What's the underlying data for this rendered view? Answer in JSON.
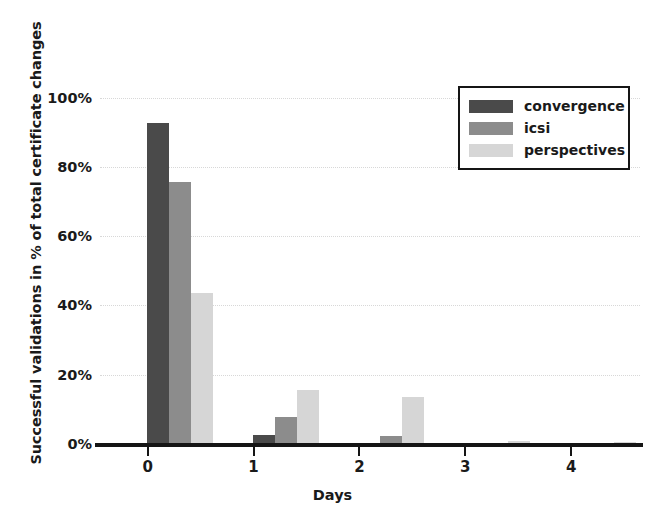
{
  "chart_data": {
    "type": "bar",
    "title": "",
    "xlabel": "Days",
    "ylabel": "Successful validations in % of total certificate changes",
    "categories": [
      "0",
      "1",
      "2",
      "3",
      "4"
    ],
    "ylim": [
      0,
      108
    ],
    "yticks": [
      0,
      20,
      40,
      60,
      80,
      100
    ],
    "ytick_labels": [
      "0%",
      "20%",
      "40%",
      "60%",
      "80%",
      "100%"
    ],
    "grid": true,
    "grid_axis": "y",
    "legend_position": "upper right",
    "series": [
      {
        "name": "convergence",
        "color": "#4a4a4a",
        "values": [
          93,
          3,
          0,
          0,
          0
        ]
      },
      {
        "name": "icsi",
        "color": "#8c8c8c",
        "values": [
          76,
          8,
          2.5,
          0,
          0
        ]
      },
      {
        "name": "perspectives",
        "color": "#d6d6d6",
        "values": [
          44,
          16,
          14,
          1.3,
          1
        ]
      }
    ]
  }
}
